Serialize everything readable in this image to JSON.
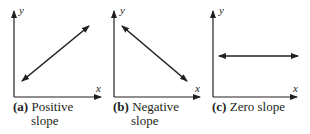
{
  "panels": [
    {
      "id": "a",
      "tag": "(a)",
      "caption_line1": "Positive",
      "caption_line2": "slope",
      "x_label": "x",
      "y_label": "y",
      "slope": "positive"
    },
    {
      "id": "b",
      "tag": "(b)",
      "caption_line1": "Negative",
      "caption_line2": "slope",
      "x_label": "x",
      "y_label": "y",
      "slope": "negative"
    },
    {
      "id": "c",
      "tag": "(c)",
      "caption_line1": "Zero slope",
      "caption_line2": "",
      "x_label": "x",
      "y_label": "y",
      "slope": "zero"
    }
  ],
  "colors": {
    "ink": "#231f20",
    "background": "#ffffff"
  }
}
